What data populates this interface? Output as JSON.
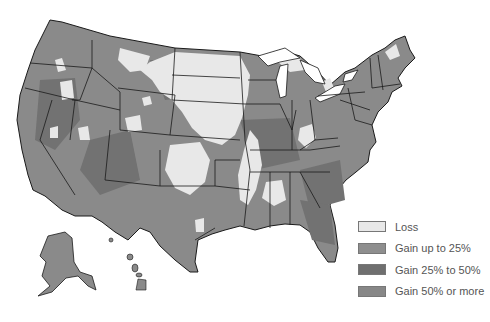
{
  "map": {
    "title": "",
    "subject": "County-level change map of the United States",
    "colors": {
      "loss": "#e8e8e8",
      "gain_up_to_25": "#8e8e8e",
      "gain_25_to_50": "#6f6f6f",
      "gain_50_or_more": "#878787",
      "border": "#1a1a1a",
      "background": "#ffffff"
    }
  },
  "legend": {
    "items": [
      {
        "label": "Loss",
        "color": "#e8e8e8"
      },
      {
        "label": "Gain up to 25%",
        "color": "#8e8e8e"
      },
      {
        "label": "Gain 25% to 50%",
        "color": "#6f6f6f"
      },
      {
        "label": "Gain 50% or more",
        "color": "#878787"
      }
    ]
  }
}
